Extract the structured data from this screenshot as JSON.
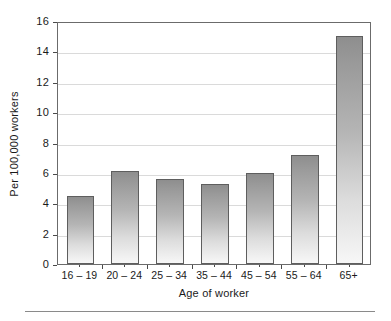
{
  "chart_data": {
    "type": "bar",
    "title": "",
    "subtitle": "",
    "xlabel": "Age of worker",
    "ylabel": "Per 100,000 workers",
    "categories": [
      "16 – 19",
      "20 – 24",
      "25 – 34",
      "35 – 44",
      "45 – 54",
      "55 – 64",
      "65+"
    ],
    "values": [
      4.5,
      6.1,
      5.6,
      5.25,
      6.0,
      7.2,
      15.0
    ],
    "series": [
      {
        "name": "Fatal injury rate",
        "values": [
          4.5,
          6.1,
          5.6,
          5.25,
          6.0,
          7.2,
          15.0
        ]
      }
    ],
    "ylim": [
      0,
      16
    ],
    "xlim": [
      0,
      7
    ],
    "ytick_labels": [
      "0",
      "2",
      "4",
      "6",
      "8",
      "10",
      "12",
      "14",
      "16"
    ],
    "ytick_values": [
      0,
      2,
      4,
      6,
      8,
      10,
      12,
      14,
      16
    ],
    "ytick_step": 2,
    "grid": "horizontal",
    "legend": "none",
    "legend_position": "none",
    "annotations": [],
    "colors": {
      "bar_top": "#8e8e8e",
      "bar_bottom": "#f7f7f7",
      "bar_border": "#5e5e5e",
      "grid": "#dadada",
      "frame": "#6b6b6b",
      "axis_text": "#1a1a1a",
      "background": "#ffffff",
      "footer_rule": "#8a8a8a"
    }
  }
}
